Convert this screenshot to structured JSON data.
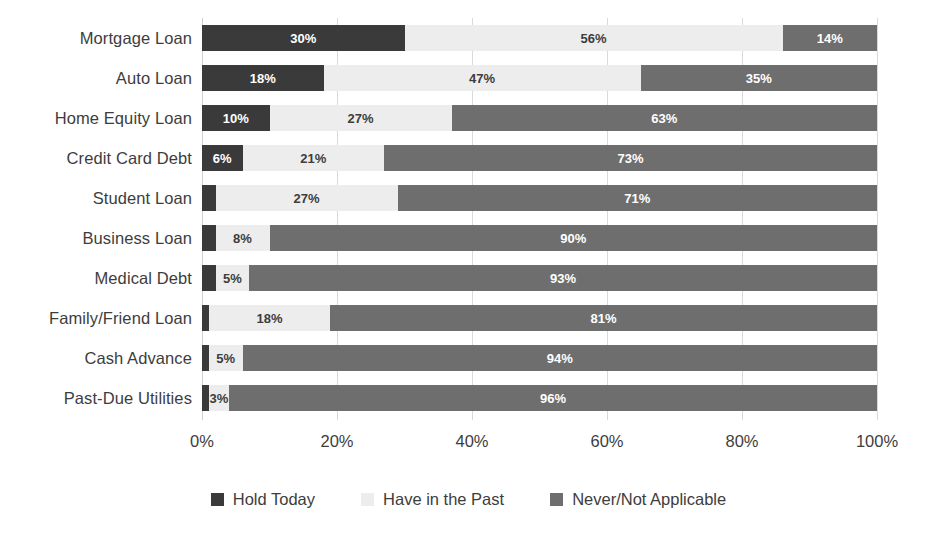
{
  "chart_data": {
    "type": "bar",
    "orientation": "horizontal",
    "stacked": true,
    "stack_total": 100,
    "title": "",
    "subtitle": "",
    "xlabel": "",
    "ylabel": "",
    "xlim": [
      0,
      100
    ],
    "grid": true,
    "legend_position": "bottom",
    "xticks": [
      "0%",
      "20%",
      "40%",
      "60%",
      "80%",
      "100%"
    ],
    "xtick_values": [
      0,
      20,
      40,
      60,
      80,
      100
    ],
    "categories": [
      "Mortgage Loan",
      "Auto Loan",
      "Home Equity Loan",
      "Credit Card Debt",
      "Student Loan",
      "Business Loan",
      "Medical Debt",
      "Family/Friend Loan",
      "Cash Advance",
      "Past-Due Utilities"
    ],
    "series": [
      {
        "name": "Hold Today",
        "color": "#3a3a3a",
        "values": [
          30,
          18,
          10,
          6,
          2,
          2,
          2,
          1,
          1,
          1
        ],
        "labels": [
          "30%",
          "18%",
          "10%",
          "6%",
          "",
          "",
          "",
          "",
          "",
          ""
        ]
      },
      {
        "name": "Have in the Past",
        "color": "#ededed",
        "values": [
          56,
          47,
          27,
          21,
          27,
          8,
          5,
          18,
          5,
          3
        ],
        "labels": [
          "56%",
          "47%",
          "27%",
          "21%",
          "27%",
          "8%",
          "5%",
          "18%",
          "5%",
          "3%"
        ]
      },
      {
        "name": "Never/Not Applicable",
        "color": "#6e6e6e",
        "values": [
          14,
          35,
          63,
          73,
          71,
          90,
          93,
          81,
          94,
          96
        ],
        "labels": [
          "14%",
          "35%",
          "63%",
          "73%",
          "71%",
          "90%",
          "93%",
          "81%",
          "94%",
          "96%"
        ]
      }
    ]
  },
  "legend": {
    "items": [
      {
        "label": "Hold Today",
        "color": "#3a3a3a"
      },
      {
        "label": "Have in the Past",
        "color": "#ededed"
      },
      {
        "label": "Never/Not Applicable",
        "color": "#6e6e6e"
      }
    ]
  },
  "colors": {
    "hold_today": "#3a3a3a",
    "have_in_past": "#ededed",
    "never_not_applicable": "#6e6e6e",
    "gridline": "#d9d9d9",
    "text": "#3d3d3d",
    "background": "#ffffff"
  }
}
